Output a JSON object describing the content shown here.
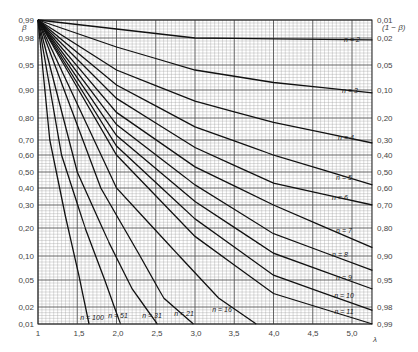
{
  "chart_data": {
    "type": "line",
    "title": "",
    "xlabel": "λ",
    "ylabel_left": "β",
    "ylabel_right": "(1 − β)",
    "xlim": [
      1,
      5.26
    ],
    "ylim": [
      0.01,
      0.99
    ],
    "y_scale": "normal-probability",
    "grid": true,
    "x_ticks": [
      {
        "value": 1,
        "label": "1",
        "px": 38
      },
      {
        "value": 1.5,
        "label": "1,5",
        "px": 79
      },
      {
        "value": 2.0,
        "label": "2,0",
        "px": 118
      },
      {
        "value": 2.5,
        "label": "2,5",
        "px": 157
      },
      {
        "value": 3.0,
        "label": "3,0",
        "px": 196
      },
      {
        "value": 3.5,
        "label": "3,5",
        "px": 234
      },
      {
        "value": 4.0,
        "label": "4,0",
        "px": 274
      },
      {
        "value": 4.5,
        "label": "4,5",
        "px": 313
      },
      {
        "value": 5.0,
        "label": "5,0",
        "px": 352
      }
    ],
    "y_ticks_left": [
      {
        "value": 0.99,
        "label": "0,99",
        "px": 20
      },
      {
        "value": 0.98,
        "label": "0,98",
        "px": 38
      },
      {
        "value": 0.95,
        "label": "0,95",
        "px": 65
      },
      {
        "value": 0.9,
        "label": "0,90",
        "px": 90
      },
      {
        "value": 0.8,
        "label": "0,80",
        "px": 118
      },
      {
        "value": 0.7,
        "label": "0,70",
        "px": 140
      },
      {
        "value": 0.6,
        "label": "0,60",
        "px": 155
      },
      {
        "value": 0.5,
        "label": "0,50",
        "px": 172
      },
      {
        "value": 0.4,
        "label": "0,40",
        "px": 188
      },
      {
        "value": 0.3,
        "label": "0,30",
        "px": 205
      },
      {
        "value": 0.2,
        "label": "0,20",
        "px": 228
      },
      {
        "value": 0.1,
        "label": "0,10",
        "px": 256
      },
      {
        "value": 0.05,
        "label": "0,05",
        "px": 280
      },
      {
        "value": 0.02,
        "label": "0,02",
        "px": 307
      },
      {
        "value": 0.01,
        "label": "0,01",
        "px": 324
      }
    ],
    "y_ticks_right": [
      {
        "label": "0,01",
        "px": 20
      },
      {
        "label": "0,02",
        "px": 38
      },
      {
        "label": "0,05",
        "px": 65
      },
      {
        "label": "0,10",
        "px": 90
      },
      {
        "label": "0,20",
        "px": 118
      },
      {
        "label": "0,30",
        "px": 140
      },
      {
        "label": "0,40",
        "px": 155
      },
      {
        "label": "0,50",
        "px": 172
      },
      {
        "label": "0,60",
        "px": 188
      },
      {
        "label": "0,70",
        "px": 205
      },
      {
        "label": "0,80",
        "px": 228
      },
      {
        "label": "0,90",
        "px": 256
      },
      {
        "label": "0,95",
        "px": 280
      },
      {
        "label": "0,98",
        "px": 307
      },
      {
        "label": "0,99",
        "px": 324
      }
    ],
    "series": [
      {
        "name": "n = 2",
        "label_pos": [
          352,
          42
        ],
        "points": [
          [
            1,
            0.99
          ],
          [
            2,
            0.985
          ],
          [
            3,
            0.98
          ],
          [
            4,
            0.979
          ],
          [
            5.26,
            0.978
          ]
        ]
      },
      {
        "name": "n = 3",
        "label_pos": [
          350,
          93
        ],
        "points": [
          [
            1,
            0.99
          ],
          [
            2,
            0.97
          ],
          [
            3,
            0.94
          ],
          [
            4,
            0.915
          ],
          [
            5.26,
            0.89
          ]
        ]
      },
      {
        "name": "n = 4",
        "label_pos": [
          346,
          140
        ],
        "points": [
          [
            1,
            0.99
          ],
          [
            2,
            0.94
          ],
          [
            3,
            0.86
          ],
          [
            4,
            0.78
          ],
          [
            5.26,
            0.68
          ]
        ]
      },
      {
        "name": "n = 5",
        "label_pos": [
          344,
          180
        ],
        "points": [
          [
            1,
            0.99
          ],
          [
            2,
            0.91
          ],
          [
            3,
            0.76
          ],
          [
            4,
            0.6
          ],
          [
            5.26,
            0.42
          ]
        ]
      },
      {
        "name": "n = 6",
        "label_pos": [
          340,
          200
        ],
        "points": [
          [
            1,
            0.99
          ],
          [
            2,
            0.87
          ],
          [
            3,
            0.65
          ],
          [
            4,
            0.43
          ],
          [
            5.26,
            0.3
          ]
        ]
      },
      {
        "name": "n = 7",
        "label_pos": [
          344,
          233
        ],
        "points": [
          [
            1,
            0.99
          ],
          [
            2,
            0.82
          ],
          [
            3,
            0.53
          ],
          [
            4,
            0.3
          ],
          [
            5.26,
            0.13
          ]
        ]
      },
      {
        "name": "n = 8",
        "label_pos": [
          340,
          257
        ],
        "points": [
          [
            1,
            0.99
          ],
          [
            2,
            0.77
          ],
          [
            3,
            0.42
          ],
          [
            4,
            0.18
          ],
          [
            5.26,
            0.07
          ]
        ]
      },
      {
        "name": "n = 9",
        "label_pos": [
          344,
          280
        ],
        "points": [
          [
            1,
            0.99
          ],
          [
            2,
            0.72
          ],
          [
            3,
            0.32
          ],
          [
            4,
            0.11
          ],
          [
            5.26,
            0.04
          ]
        ]
      },
      {
        "name": "n = 10",
        "label_pos": [
          344,
          298
        ],
        "points": [
          [
            1,
            0.99
          ],
          [
            2,
            0.66
          ],
          [
            3,
            0.24
          ],
          [
            4,
            0.06
          ],
          [
            5.26,
            0.018
          ]
        ]
      },
      {
        "name": "n = 11",
        "label_pos": [
          344,
          314
        ],
        "points": [
          [
            1,
            0.99
          ],
          [
            2,
            0.6
          ],
          [
            3,
            0.17
          ],
          [
            4,
            0.035
          ],
          [
            5.26,
            0.01
          ]
        ]
      },
      {
        "name": "n = 16",
        "label_pos": [
          222,
          312
        ],
        "points": [
          [
            1,
            0.99
          ],
          [
            2,
            0.4
          ],
          [
            2.8,
            0.1
          ],
          [
            3.3,
            0.03
          ],
          [
            3.78,
            0.01
          ]
        ]
      },
      {
        "name": "n = 21",
        "label_pos": [
          184,
          316
        ],
        "points": [
          [
            1,
            0.99
          ],
          [
            1.8,
            0.4
          ],
          [
            2.3,
            0.1
          ],
          [
            2.6,
            0.03
          ],
          [
            2.98,
            0.01
          ]
        ]
      },
      {
        "name": "n = 31",
        "label_pos": [
          152,
          318
        ],
        "points": [
          [
            1,
            0.99
          ],
          [
            1.5,
            0.5
          ],
          [
            1.9,
            0.15
          ],
          [
            2.2,
            0.04
          ],
          [
            2.52,
            0.01
          ]
        ]
      },
      {
        "name": "n = 51",
        "label_pos": [
          118,
          318
        ],
        "points": [
          [
            1,
            0.99
          ],
          [
            1.3,
            0.6
          ],
          [
            1.6,
            0.2
          ],
          [
            1.85,
            0.05
          ],
          [
            2.05,
            0.01
          ]
        ]
      },
      {
        "name": "n = 100",
        "label_pos": [
          92,
          320
        ],
        "points": [
          [
            1,
            0.99
          ],
          [
            1.15,
            0.7
          ],
          [
            1.35,
            0.25
          ],
          [
            1.52,
            0.06
          ],
          [
            1.65,
            0.01
          ]
        ]
      }
    ]
  },
  "plot_area": {
    "left": 38,
    "top": 20,
    "right": 372,
    "bottom": 324
  },
  "colors": {
    "curve": "#111111",
    "grid_major": "#555555",
    "grid_minor": "#9a9a9a",
    "text": "#444444"
  }
}
